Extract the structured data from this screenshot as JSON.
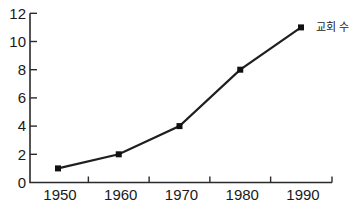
{
  "chart_data": {
    "type": "line",
    "title": "",
    "xlabel": "",
    "ylabel": "",
    "annotation": "교회 수",
    "categories": [
      "1950",
      "1960",
      "1970",
      "1980",
      "1990"
    ],
    "series": [
      {
        "name": "교회 수",
        "values": [
          1,
          2,
          4,
          8,
          11
        ]
      }
    ],
    "y_ticks": [
      0,
      2,
      4,
      6,
      8,
      10,
      12
    ],
    "ylim": [
      0,
      12
    ],
    "grid": false,
    "legend_position": "annotation-right-of-last-point",
    "x_tick_style": "between-categories-plus-axis-end",
    "marker": "filled-square",
    "colors": {
      "line": "#1f1f1f",
      "marker": "#111111",
      "axis": "#2b2b2b",
      "text": "#1a1a1a",
      "background": "#ffffff"
    }
  }
}
